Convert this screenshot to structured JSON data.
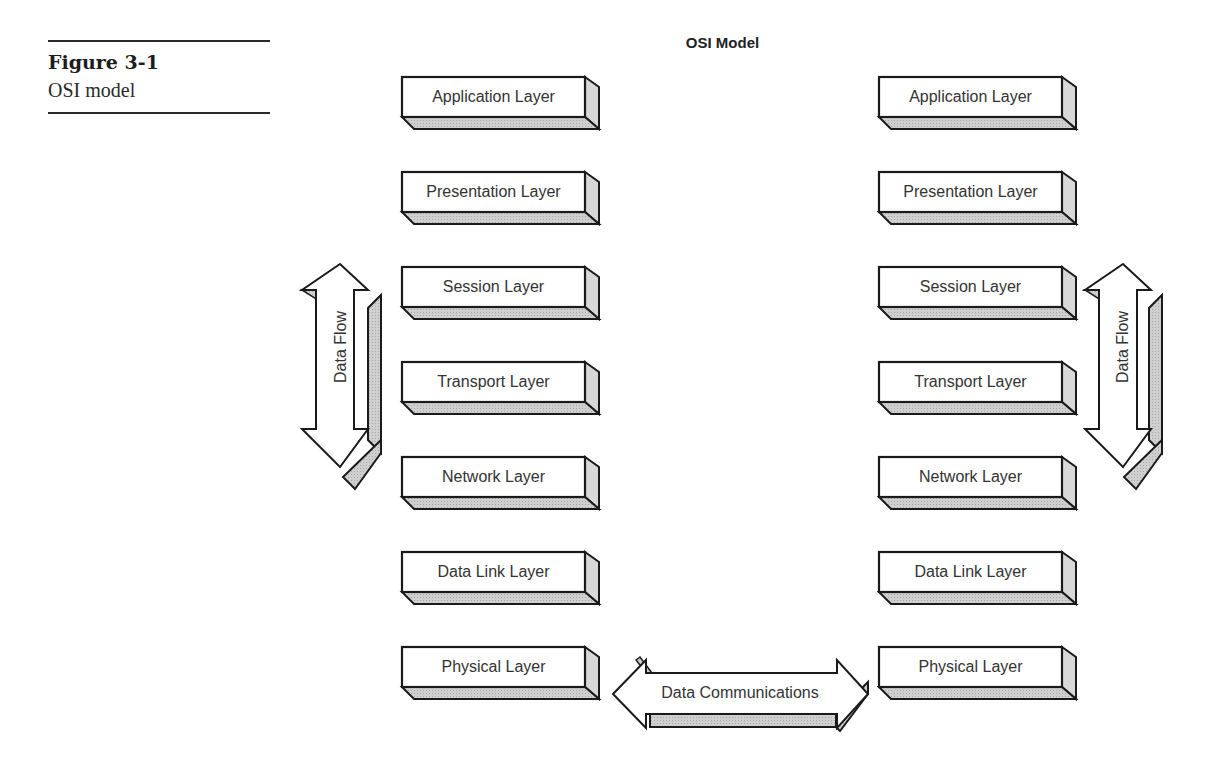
{
  "caption": {
    "figure_number": "Figure 3-1",
    "figure_title": "OSI model"
  },
  "diagram": {
    "title": "OSI Model",
    "left_stack": {
      "layers": [
        "Application Layer",
        "Presentation Layer",
        "Session Layer",
        "Transport Layer",
        "Network Layer",
        "Data Link Layer",
        "Physical Layer"
      ]
    },
    "right_stack": {
      "layers": [
        "Application Layer",
        "Presentation Layer",
        "Session Layer",
        "Transport Layer",
        "Network Layer",
        "Data Link Layer",
        "Physical Layer"
      ]
    },
    "left_arrow_label": "Data Flow",
    "right_arrow_label": "Data Flow",
    "bottom_arrow_label": "Data Communications",
    "colors": {
      "outline": "#1a1a1a",
      "face": "#ffffff",
      "shadow": "#c8c8c8",
      "text": "#333333"
    }
  }
}
